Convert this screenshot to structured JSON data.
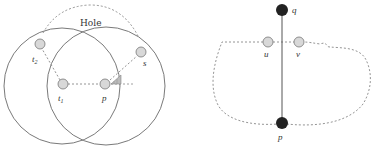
{
  "colors": {
    "stroke": "#666666",
    "dashed": "#888888",
    "node_fill": "#d8d8d8",
    "node_stroke": "#777777",
    "black_node": "#222222",
    "wedge": "#bbbbbb"
  },
  "left_diagram": {
    "hole_label": "Hole",
    "nodes": [
      {
        "id": "t2",
        "base": "t",
        "sub": "2"
      },
      {
        "id": "t1",
        "base": "t",
        "sub": "1"
      },
      {
        "id": "p",
        "label": "p"
      },
      {
        "id": "s",
        "label": "s"
      }
    ]
  },
  "right_diagram": {
    "nodes": [
      {
        "id": "q",
        "label": "q"
      },
      {
        "id": "u",
        "label": "u"
      },
      {
        "id": "v",
        "label": "v"
      },
      {
        "id": "p",
        "label": "p"
      }
    ]
  }
}
